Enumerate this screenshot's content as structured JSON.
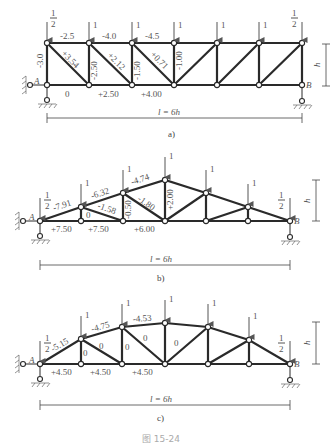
{
  "figure": {
    "caption": "图 15-24",
    "panels": [
      {
        "id": "a",
        "label": "a)",
        "type": "parallel-chord truss",
        "span_label": "l = 6h",
        "height_label": "h",
        "support_left": "A",
        "support_right": "B",
        "loads": [
          "1/2",
          "1",
          "1",
          "1",
          "1",
          "1",
          "1/2"
        ],
        "load_half_num": "1",
        "load_half_den": "2",
        "load_unit": "1",
        "member_forces": {
          "top": [
            "-2.5",
            "-4.0",
            "-4.5"
          ],
          "bottom": [
            "0",
            "+2.50",
            "+4.00"
          ],
          "verticals": [
            "-3.0",
            "-2.50",
            "-1.50",
            "-1.00"
          ],
          "diagonals": [
            "+3.54",
            "+2.12",
            "+0.71"
          ]
        }
      },
      {
        "id": "b",
        "label": "b)",
        "type": "triangular truss",
        "span_label": "l = 6h",
        "height_label": "h",
        "support_left": "A",
        "support_right": "B",
        "loads": [
          "1/2",
          "1",
          "1",
          "1",
          "1",
          "1",
          "1/2"
        ],
        "member_forces": {
          "top": [
            "-7.91",
            "-6.32",
            "-4.74"
          ],
          "bottom": [
            "+7.50",
            "+7.50",
            "+6.00"
          ],
          "verticals": [
            "0",
            "-0.50",
            "+2.00"
          ],
          "diagonals": [
            "-1.58",
            "-1.80"
          ]
        }
      },
      {
        "id": "c",
        "label": "c)",
        "type": "parabolic (curved-chord) truss",
        "span_label": "l = 6h",
        "height_label": "h",
        "support_left": "A",
        "support_right": "B",
        "loads": [
          "1/2",
          "1",
          "1",
          "1",
          "1",
          "1",
          "1/2"
        ],
        "member_forces": {
          "top": [
            "-5.15",
            "-4.75",
            "-4.53"
          ],
          "bottom": [
            "+4.50",
            "+4.50",
            "+4.50"
          ],
          "verticals": [
            "0",
            "0",
            "0"
          ],
          "diagonals": [
            "0",
            "0"
          ]
        }
      }
    ]
  }
}
